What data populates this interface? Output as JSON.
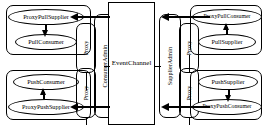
{
  "diagram": {
    "center": {
      "event_channel_label": "EventChannel",
      "consumer_admin_label": "ConsumerAdmin",
      "supplier_admin_label": "SupplierAdmin",
      "proxy_label": "Proxy"
    },
    "quadrants": {
      "top_left": {
        "proxy_node": "ProxyPullSupplier",
        "client_node": "PullConsumer",
        "internal_arrow": "down",
        "channel_arrow": "left"
      },
      "bottom_left": {
        "proxy_node": "ProxyPushSupplier",
        "client_node": "PushConsumer",
        "internal_arrow": "up",
        "channel_arrow": "left"
      },
      "top_right": {
        "proxy_node": "ProxyPullConsumer",
        "client_node": "PullSupplier",
        "internal_arrow": "up",
        "channel_arrow": "left"
      },
      "bottom_right": {
        "proxy_node": "ProxyPushConsumer",
        "client_node": "PushSupplier",
        "internal_arrow": "down",
        "channel_arrow": "left"
      }
    },
    "colors": {
      "stroke": "#000000",
      "background": "#ffffff"
    }
  }
}
